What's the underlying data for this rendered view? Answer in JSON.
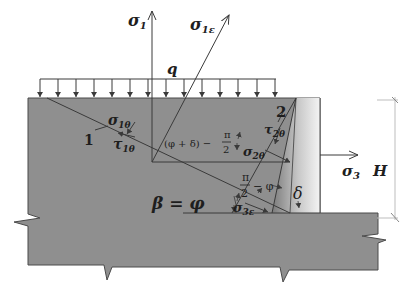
{
  "diagram": {
    "title": "",
    "colors": {
      "soil_fill": "#8f8f8f",
      "wall_fill_light": "#f2f2f2",
      "wall_fill_dark": "#7a7a7a",
      "line": "#3a3a3a",
      "text": "#1e1e1e",
      "dimension_line": "#bdbdbd"
    },
    "labels": {
      "sigma_1": "σ",
      "sigma_1_sub": "1",
      "sigma_1e": "σ",
      "sigma_1e_sub": "1ε",
      "q": "q",
      "sigma_1theta": "σ",
      "sigma_1theta_sub": "1θ",
      "tau_1theta": "τ",
      "tau_1theta_sub": "1θ",
      "line_1": "1",
      "line_2": "2",
      "angle_phi_plus_delta": "(φ + δ) −",
      "pi_over_2_a_num": "π",
      "pi_over_2_a_den": "2",
      "tau_2theta": "τ",
      "tau_2theta_sub": "2θ",
      "sigma_2theta": "σ",
      "sigma_2theta_sub": "2θ",
      "sigma_3": "σ",
      "sigma_3_sub": "3",
      "H": "H",
      "beta_eq_phi": "β = φ",
      "pi_over_2_b_num": "π",
      "pi_over_2_b_den": "2",
      "minus_phi": "− φ",
      "delta": "δ",
      "sigma_3e": "σ",
      "sigma_3e_sub": "3ε"
    },
    "elements": [
      "soil block with break marks",
      "retaining wall (shaded)",
      "uniform surcharge load q",
      "principal stress arrows σ1, σ1ε, σ3",
      "slip lines 1 and 2",
      "angle annotations β = φ, (φ+δ) − π/2, π/2 − φ, δ",
      "height dimension H"
    ]
  }
}
